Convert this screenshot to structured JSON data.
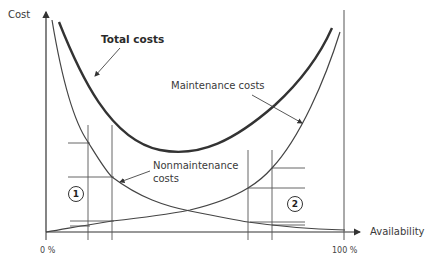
{
  "diagram": {
    "type": "cost-availability-tradeoff",
    "axes": {
      "y_label": "Cost",
      "x_label": "Availability",
      "x_start_tick": "0 %",
      "x_end_tick": "100 %"
    },
    "curves": [
      {
        "name": "Total costs",
        "style": "thick",
        "shape": "U-shaped, minimum near mid availability"
      },
      {
        "name": "Maintenance costs",
        "style": "thin",
        "shape": "rising steeply toward 100%"
      },
      {
        "name": "Nonmaintenance costs",
        "style": "thin",
        "shape": "falling from high at 0%"
      }
    ],
    "labels": {
      "total_costs": "Total costs",
      "maintenance_costs": "Maintenance costs",
      "nonmaintenance_line1": "Nonmaintenance",
      "nonmaintenance_line2": "costs"
    },
    "regions": [
      {
        "marker": "1",
        "description": "low availability region"
      },
      {
        "marker": "2",
        "description": "high availability region"
      }
    ],
    "colors": {
      "line": "#3a3a3a",
      "text": "#3a3a3a",
      "background": "#ffffff"
    }
  }
}
